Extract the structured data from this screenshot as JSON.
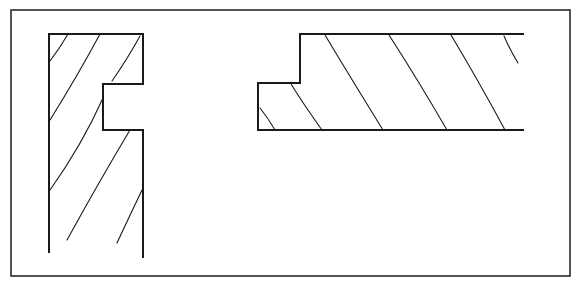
{
  "diagram": {
    "colors": {
      "background": "#ffffff",
      "stroke": "#1a1a1a",
      "frame": "#2a2a2a"
    },
    "frame": {
      "x1": 11,
      "y1": 10,
      "x2": 570,
      "y2": 276
    },
    "profiles": [
      {
        "name": "vertical-grooved-board",
        "outline": "M49,253 L49,34 L143,34 L143,84 L103,84 L103,130 L143,130 L143,258",
        "hatch": [
          "M68,34 Q60,48 50,61",
          "M100,34 Q78,75 50,120",
          "M140,36 Q128,58 112,81",
          "M103,98 Q82,145 50,190",
          "M130,130 Q100,180 67,240",
          "M143,188 Q130,215 117,243"
        ]
      },
      {
        "name": "horizontal-rabbeted-board",
        "outline": "M524,34 L300,34 L300,83 L258,83 L258,130 L524,130",
        "hatch": [
          "M260,108 Q268,118 275,130",
          "M291,84 Q304,105 322,130",
          "M325,35 Q352,80 383,130",
          "M389,35 Q418,80 447,130",
          "M451,35 Q478,80 505,130",
          "M504,36 Q510,50 518,63"
        ]
      }
    ]
  }
}
